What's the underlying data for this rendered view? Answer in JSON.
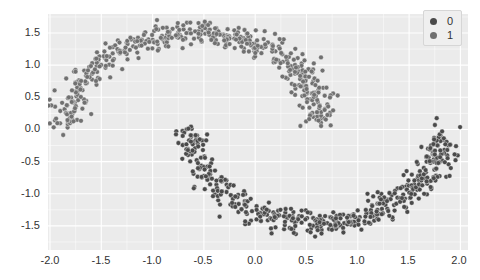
{
  "chart_data": {
    "type": "scatter",
    "title": "",
    "xlabel": "",
    "ylabel": "",
    "xlim": [
      -2.0,
      2.0
    ],
    "ylim": [
      -1.75,
      1.75
    ],
    "x_ticks": [
      "-2.0",
      "-1.5",
      "-1.0",
      "-0.5",
      "0.0",
      "0.5",
      "1.0",
      "1.5",
      "2.0"
    ],
    "y_ticks": [
      "1.5",
      "1.0",
      "0.5",
      "0.0",
      "-0.5",
      "-1.0",
      "-1.5"
    ],
    "grid": true,
    "legend_position": "upper right",
    "series": [
      {
        "name": "0",
        "color": "#4a4a4a",
        "shape": "lower moon",
        "center_x": 0.6,
        "center_y": -0.1,
        "x_range": [
          -0.65,
          1.85
        ],
        "y_range": [
          -1.65,
          0.65
        ]
      },
      {
        "name": "1",
        "color": "#707070",
        "shape": "upper moon",
        "center_x": -0.6,
        "center_y": 0.1,
        "x_range": [
          -1.85,
          0.65
        ],
        "y_range": [
          -0.6,
          1.65
        ]
      }
    ]
  },
  "legend": {
    "items": [
      {
        "label": "0",
        "color": "#4a4a4a"
      },
      {
        "label": "1",
        "color": "#707070"
      }
    ]
  }
}
